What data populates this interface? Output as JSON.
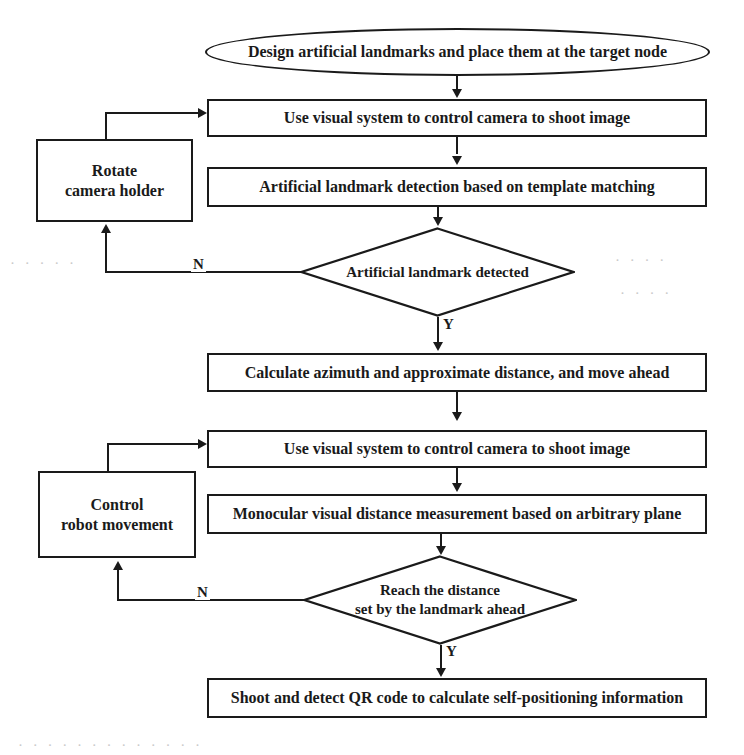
{
  "diagram": {
    "type": "flowchart",
    "width": 744,
    "height": 755,
    "stroke_color": "#1a1a1a",
    "background_color": "#ffffff"
  },
  "nodes": {
    "start": {
      "shape": "terminator",
      "label": "Design artificial landmarks and place them at the target node",
      "x": 205,
      "y": 28,
      "w": 505,
      "h": 48
    },
    "shoot_image_1": {
      "shape": "process",
      "label": "Use visual system to control camera to shoot image",
      "x": 207,
      "y": 99,
      "w": 500,
      "h": 38
    },
    "rotate_camera_holder": {
      "shape": "process",
      "label": "Rotate\ncamera holder",
      "x": 36,
      "y": 139,
      "w": 157,
      "h": 83
    },
    "landmark_detection": {
      "shape": "process",
      "label": "Artificial landmark detection based on template matching",
      "x": 207,
      "y": 167,
      "w": 500,
      "h": 40
    },
    "decision_landmark": {
      "shape": "decision",
      "label": "Artificial landmark detected",
      "x": 300,
      "y": 227,
      "w": 275,
      "h": 90
    },
    "calculate_azimuth": {
      "shape": "process",
      "label": "Calculate azimuth and approximate distance, and move ahead",
      "x": 207,
      "y": 353,
      "w": 500,
      "h": 39
    },
    "shoot_image_2": {
      "shape": "process",
      "label": "Use visual system to control camera to shoot image",
      "x": 207,
      "y": 430,
      "w": 500,
      "h": 38
    },
    "control_robot_movement": {
      "shape": "process",
      "label": "Control\nrobot movement",
      "x": 38,
      "y": 471,
      "w": 158,
      "h": 87
    },
    "monocular_measurement": {
      "shape": "process",
      "label": "Monocular visual distance measurement based on arbitrary plane",
      "x": 207,
      "y": 494,
      "w": 500,
      "h": 40
    },
    "decision_distance": {
      "shape": "decision",
      "label": "Reach the distance\nset by the landmark ahead",
      "x": 303,
      "y": 555,
      "w": 274,
      "h": 90
    },
    "qr_code": {
      "shape": "process",
      "label": "Shoot and detect QR code to calculate self-positioning information",
      "x": 207,
      "y": 678,
      "w": 500,
      "h": 40
    }
  },
  "edge_labels": {
    "landmark_no": "N",
    "landmark_yes": "Y",
    "distance_no": "N",
    "distance_yes": "Y"
  },
  "edges": [
    {
      "from": "start",
      "to": "shoot_image_1",
      "label": ""
    },
    {
      "from": "shoot_image_1",
      "to": "landmark_detection",
      "label": ""
    },
    {
      "from": "landmark_detection",
      "to": "decision_landmark",
      "label": ""
    },
    {
      "from": "decision_landmark",
      "to": "rotate_camera_holder",
      "label": "N"
    },
    {
      "from": "rotate_camera_holder",
      "to": "shoot_image_1",
      "label": ""
    },
    {
      "from": "decision_landmark",
      "to": "calculate_azimuth",
      "label": "Y"
    },
    {
      "from": "calculate_azimuth",
      "to": "shoot_image_2",
      "label": ""
    },
    {
      "from": "shoot_image_2",
      "to": "monocular_measurement",
      "label": ""
    },
    {
      "from": "monocular_measurement",
      "to": "decision_distance",
      "label": ""
    },
    {
      "from": "decision_distance",
      "to": "control_robot_movement",
      "label": "N"
    },
    {
      "from": "control_robot_movement",
      "to": "shoot_image_2",
      "label": ""
    },
    {
      "from": "decision_distance",
      "to": "qr_code",
      "label": "Y"
    }
  ],
  "artifacts": [
    {
      "text": "·  ·   ·  · ·",
      "x": 10,
      "y": 255
    },
    {
      "text": "· ·   ·  ·",
      "x": 615,
      "y": 252
    },
    {
      "text": "·  ·  ·   ·",
      "x": 620,
      "y": 285
    },
    {
      "text": "·  ·  ·  ·  ·  ·   ·  ·  ·  ·  ·   ·  ·",
      "x": 18,
      "y": 737
    }
  ]
}
